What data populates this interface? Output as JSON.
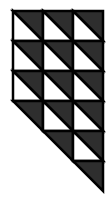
{
  "diagram": {
    "colors": {
      "dark": "#2e2e2e",
      "light": "#ffffff",
      "line": "#000000"
    },
    "grid": {
      "x0": 13,
      "y0": 11,
      "cell": 30,
      "cols": 3,
      "full_rows": 3
    },
    "cells": [
      {
        "row": 0,
        "col": 0,
        "type": "split"
      },
      {
        "row": 0,
        "col": 1,
        "type": "split"
      },
      {
        "row": 0,
        "col": 2,
        "type": "split"
      },
      {
        "row": 1,
        "col": 0,
        "type": "split"
      },
      {
        "row": 1,
        "col": 1,
        "type": "split"
      },
      {
        "row": 1,
        "col": 2,
        "type": "split"
      },
      {
        "row": 2,
        "col": 0,
        "type": "split"
      },
      {
        "row": 2,
        "col": 1,
        "type": "split"
      },
      {
        "row": 2,
        "col": 2,
        "type": "split"
      },
      {
        "row": 3,
        "col": 0,
        "type": "dark-half"
      },
      {
        "row": 3,
        "col": 1,
        "type": "split"
      },
      {
        "row": 3,
        "col": 2,
        "type": "split"
      },
      {
        "row": 4,
        "col": 1,
        "type": "dark-half"
      },
      {
        "row": 4,
        "col": 2,
        "type": "split"
      },
      {
        "row": 5,
        "col": 2,
        "type": "dark-half"
      }
    ]
  }
}
